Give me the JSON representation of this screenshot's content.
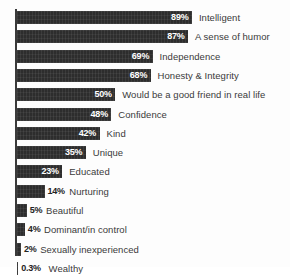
{
  "chart_data": {
    "type": "bar",
    "orientation": "horizontal",
    "title": "",
    "subtitle": "",
    "xlabel": "",
    "ylabel": "",
    "xlim": [
      0,
      100
    ],
    "grid": false,
    "legend": null,
    "axis": {
      "visible_axis": "y",
      "axis_color": "#3a3a3a"
    },
    "bar_color": "#2d2d2d",
    "categories": [
      "Intelligent",
      "A sense of humor",
      "Independence",
      "Honesty & Integrity",
      "Would be a good friend in real life",
      "Confidence",
      "Kind",
      "Unique",
      "Educated",
      "Nurturing",
      "Beautiful",
      "Dominant/in control",
      "Sexually inexperienced",
      "Wealthy"
    ],
    "values": [
      89,
      87,
      69,
      68,
      50,
      48,
      42,
      35,
      23,
      14,
      5,
      4,
      2,
      0.3
    ],
    "value_labels": [
      "89%",
      "87%",
      "69%",
      "68%",
      "50%",
      "48%",
      "42%",
      "35%",
      "23%",
      "14%",
      "5%",
      "4%",
      "2%",
      "0.3%"
    ],
    "label_placement": [
      "inside",
      "inside",
      "inside",
      "inside",
      "inside",
      "inside",
      "inside",
      "inside",
      "inside",
      "outside",
      "outside",
      "outside",
      "outside",
      "outside"
    ]
  },
  "bars": [
    {
      "label": "Intelligent",
      "value": 89,
      "value_label": "89%",
      "placement": "inside"
    },
    {
      "label": "A sense of humor",
      "value": 87,
      "value_label": "87%",
      "placement": "inside"
    },
    {
      "label": "Independence",
      "value": 69,
      "value_label": "69%",
      "placement": "inside"
    },
    {
      "label": "Honesty & Integrity",
      "value": 68,
      "value_label": "68%",
      "placement": "inside"
    },
    {
      "label": "Would be a good friend in real life",
      "value": 50,
      "value_label": "50%",
      "placement": "inside"
    },
    {
      "label": "Confidence",
      "value": 48,
      "value_label": "48%",
      "placement": "inside"
    },
    {
      "label": "Kind",
      "value": 42,
      "value_label": "42%",
      "placement": "inside"
    },
    {
      "label": "Unique",
      "value": 35,
      "value_label": "35%",
      "placement": "inside"
    },
    {
      "label": "Educated",
      "value": 23,
      "value_label": "23%",
      "placement": "inside"
    },
    {
      "label": "Nurturing",
      "value": 14,
      "value_label": "14%",
      "placement": "outside"
    },
    {
      "label": "Beautiful",
      "value": 5,
      "value_label": "5%",
      "placement": "outside"
    },
    {
      "label": "Dominant/in control",
      "value": 4,
      "value_label": "4%",
      "placement": "outside"
    },
    {
      "label": "Sexually inexperienced",
      "value": 2,
      "value_label": "2%",
      "placement": "outside"
    },
    {
      "label": "Wealthy",
      "value": 0.3,
      "value_label": "0.3%",
      "placement": "outside"
    }
  ]
}
